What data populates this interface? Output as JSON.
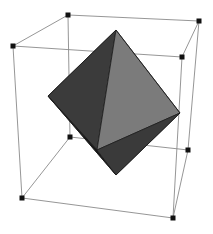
{
  "figure": {
    "background_color": "#ffffff",
    "width": 213,
    "height": 234
  },
  "chart_data": {
    "type": "scatter",
    "xlabel": "",
    "ylabel": "",
    "grid": false,
    "legend": false,
    "projection": "3d-perspective",
    "xlim": [
      0,
      213
    ],
    "ylim": [
      0,
      234
    ],
    "cube": {
      "name": "bounding-cube",
      "edge_color": "#8a8a8a",
      "edge_width": 0.9,
      "vertex_marker": "filled-square",
      "vertex_color": "#111111",
      "vertex_size": 5,
      "vertices": [
        {
          "id": "v0",
          "label": "top-back-left",
          "x": 68,
          "y": 15
        },
        {
          "id": "v1",
          "label": "top-back-right",
          "x": 199,
          "y": 21
        },
        {
          "id": "v2",
          "label": "top-front-left",
          "x": 13,
          "y": 46
        },
        {
          "id": "v3",
          "label": "top-front-right",
          "x": 182,
          "y": 57
        },
        {
          "id": "v4",
          "label": "bottom-back-left",
          "x": 70,
          "y": 137
        },
        {
          "id": "v5",
          "label": "bottom-back-right",
          "x": 188,
          "y": 150
        },
        {
          "id": "v6",
          "label": "bottom-front-left",
          "x": 22,
          "y": 198
        },
        {
          "id": "v7",
          "label": "bottom-front-right",
          "x": 173,
          "y": 218
        }
      ],
      "edges": [
        [
          "v0",
          "v1"
        ],
        [
          "v0",
          "v2"
        ],
        [
          "v1",
          "v3"
        ],
        [
          "v2",
          "v3"
        ],
        [
          "v4",
          "v5"
        ],
        [
          "v4",
          "v6"
        ],
        [
          "v5",
          "v7"
        ],
        [
          "v6",
          "v7"
        ],
        [
          "v0",
          "v4"
        ],
        [
          "v1",
          "v5"
        ],
        [
          "v2",
          "v6"
        ],
        [
          "v3",
          "v7"
        ]
      ]
    },
    "octahedron": {
      "name": "octahedron-solid",
      "edge_color": "#1c1c1c",
      "edge_width": 0.8,
      "vertices": [
        {
          "id": "o_top",
          "label": "apex-top",
          "x": 116,
          "y": 30
        },
        {
          "id": "o_bottom",
          "label": "apex-bottom",
          "x": 116,
          "y": 175
        },
        {
          "id": "o_left",
          "label": "equator-left",
          "x": 48,
          "y": 96
        },
        {
          "id": "o_right",
          "label": "equator-right",
          "x": 180,
          "y": 113
        },
        {
          "id": "o_front",
          "label": "equator-front",
          "x": 97,
          "y": 150
        },
        {
          "id": "o_back",
          "label": "equator-back",
          "x": 131,
          "y": 58
        }
      ],
      "faces": [
        {
          "id": "f_top_left",
          "verts": [
            "o_top",
            "o_left",
            "o_front"
          ],
          "color": "#3b3b3b",
          "shade": "dark"
        },
        {
          "id": "f_top_right",
          "verts": [
            "o_top",
            "o_front",
            "o_right"
          ],
          "color": "#7b7b7b",
          "shade": "light"
        },
        {
          "id": "f_bottom_left",
          "verts": [
            "o_bottom",
            "o_left",
            "o_front"
          ],
          "color": "#161616",
          "shade": "darkest"
        },
        {
          "id": "f_bottom_right",
          "verts": [
            "o_bottom",
            "o_front",
            "o_right"
          ],
          "color": "#3a3a3a",
          "shade": "dark"
        }
      ],
      "silhouette": [
        "o_top",
        "o_right",
        "o_bottom",
        "o_left"
      ]
    },
    "colors": {
      "face_light": "#7b7b7b",
      "face_dark": "#3b3b3b",
      "face_darkest": "#161616",
      "cube_edge": "#8a8a8a",
      "vertex": "#111111",
      "background": "#ffffff"
    }
  }
}
